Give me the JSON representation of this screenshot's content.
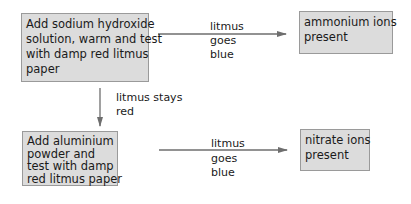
{
  "diagram": {
    "type": "flowchart",
    "nodes": {
      "step1": {
        "lines": [
          "Add sodium hydroxide",
          "solution, warm and test",
          "with damp red litmus",
          "paper"
        ]
      },
      "result1": {
        "lines": [
          "ammonium ions",
          "present"
        ]
      },
      "step2": {
        "lines": [
          "Add aluminium",
          "powder and",
          "test with damp",
          "red litmus paper"
        ]
      },
      "result2": {
        "lines": [
          "nitrate ions",
          "present"
        ]
      }
    },
    "edges": {
      "step1_to_result1": {
        "lines": [
          "litmus",
          "goes",
          "blue"
        ]
      },
      "step1_to_step2": {
        "lines": [
          "litmus stays",
          "red"
        ]
      },
      "step2_to_result2": {
        "lines": [
          "litmus",
          "goes",
          "blue"
        ]
      }
    },
    "colors": {
      "box_fill": "#dcdcdc",
      "box_border": "#9a9a9a",
      "arrow": "#6e6e6e",
      "text": "#1a1a1a"
    }
  }
}
